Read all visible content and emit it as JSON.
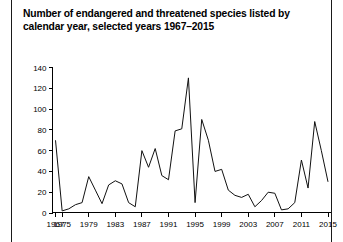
{
  "title": {
    "line1": "Number of endangered and threatened species listed by",
    "line2": "calendar year, selected years 1967–2015"
  },
  "colors": {
    "line": "#111111",
    "axis": "#000000",
    "background": "#ffffff",
    "border": "#1a1a1a"
  },
  "chart_data": {
    "type": "line",
    "title": "Number of endangered and threatened species listed by calendar year, selected years 1967–2015",
    "xlabel": "",
    "ylabel": "",
    "ylim": [
      0,
      140
    ],
    "yticks": [
      0,
      20,
      40,
      60,
      80,
      100,
      120,
      140
    ],
    "ytick_labels": [
      "0",
      "20",
      "40",
      "60",
      "80",
      "100",
      "120",
      "140"
    ],
    "xtick_labels": [
      "1967",
      "1975",
      "1979",
      "1983",
      "1987",
      "1991",
      "1995",
      "1999",
      "2003",
      "2007",
      "2011",
      "2015"
    ],
    "grid": false,
    "legend": false,
    "x": [
      1967,
      1975,
      1976,
      1977,
      1978,
      1979,
      1980,
      1981,
      1982,
      1983,
      1984,
      1985,
      1986,
      1987,
      1988,
      1989,
      1990,
      1991,
      1992,
      1993,
      1994,
      1995,
      1996,
      1997,
      1998,
      1999,
      2000,
      2001,
      2002,
      2003,
      2004,
      2005,
      2006,
      2007,
      2008,
      2009,
      2010,
      2011,
      2012,
      2013,
      2014,
      2015
    ],
    "values": [
      70,
      2,
      4,
      8,
      10,
      35,
      22,
      9,
      27,
      31,
      28,
      10,
      6,
      60,
      44,
      62,
      36,
      32,
      79,
      81,
      130,
      10,
      90,
      70,
      40,
      42,
      22,
      17,
      15,
      18,
      6,
      12,
      20,
      19,
      3,
      4,
      10,
      51,
      24,
      88,
      60,
      30
    ],
    "series": [
      {
        "name": "Species listed",
        "values": [
          70,
          2,
          4,
          8,
          10,
          35,
          22,
          9,
          27,
          31,
          28,
          10,
          6,
          60,
          44,
          62,
          36,
          32,
          79,
          81,
          130,
          10,
          90,
          70,
          40,
          42,
          22,
          17,
          15,
          18,
          6,
          12,
          20,
          19,
          3,
          4,
          10,
          51,
          24,
          88,
          60,
          30
        ]
      }
    ]
  }
}
